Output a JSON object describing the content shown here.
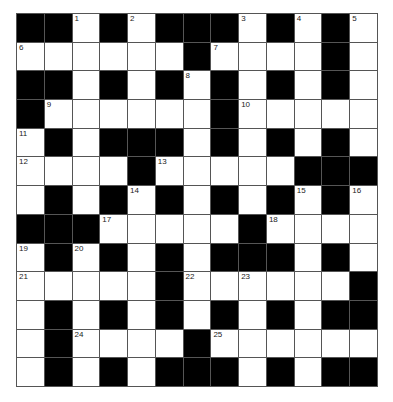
{
  "puzzle": {
    "rows": 13,
    "cols": 13,
    "layout": [
      "BBWBWBBBWBWBW",
      "WWWWWWBWWWWBW",
      "BBWBWBWBWBWBW",
      "BWWWWWWBWWWWW",
      "WBWBBBWBWBWBW",
      "WWWWBWWWWWBBB",
      "WBWBWBWBWBWBW",
      "BBBWWWWWBWWWW",
      "WBWBWBWBBBWBW",
      "WWWWWBWWWWWWB",
      "WBWBWBWBWBWBB",
      "WBWWWWBWWWWWW",
      "WBWBWBBBWBWBB"
    ],
    "numbers": [
      {
        "r": 0,
        "c": 2,
        "n": "1"
      },
      {
        "r": 0,
        "c": 4,
        "n": "2"
      },
      {
        "r": 0,
        "c": 8,
        "n": "3"
      },
      {
        "r": 0,
        "c": 10,
        "n": "4"
      },
      {
        "r": 0,
        "c": 12,
        "n": "5"
      },
      {
        "r": 1,
        "c": 0,
        "n": "6"
      },
      {
        "r": 1,
        "c": 7,
        "n": "7"
      },
      {
        "r": 2,
        "c": 6,
        "n": "8"
      },
      {
        "r": 3,
        "c": 1,
        "n": "9"
      },
      {
        "r": 3,
        "c": 8,
        "n": "10"
      },
      {
        "r": 4,
        "c": 0,
        "n": "11"
      },
      {
        "r": 5,
        "c": 0,
        "n": "12"
      },
      {
        "r": 5,
        "c": 5,
        "n": "13"
      },
      {
        "r": 6,
        "c": 4,
        "n": "14"
      },
      {
        "r": 6,
        "c": 10,
        "n": "15"
      },
      {
        "r": 6,
        "c": 12,
        "n": "16"
      },
      {
        "r": 7,
        "c": 3,
        "n": "17"
      },
      {
        "r": 7,
        "c": 9,
        "n": "18"
      },
      {
        "r": 8,
        "c": 0,
        "n": "19"
      },
      {
        "r": 8,
        "c": 2,
        "n": "20"
      },
      {
        "r": 9,
        "c": 0,
        "n": "21"
      },
      {
        "r": 9,
        "c": 6,
        "n": "22"
      },
      {
        "r": 9,
        "c": 8,
        "n": "23"
      },
      {
        "r": 11,
        "c": 2,
        "n": "24"
      },
      {
        "r": 11,
        "c": 7,
        "n": "25"
      }
    ],
    "colors": {
      "block": "#000000",
      "empty": "#ffffff",
      "line": "#555555"
    }
  }
}
